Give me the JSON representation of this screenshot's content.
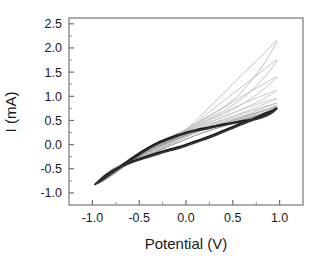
{
  "chart_data": {
    "type": "line",
    "title": "",
    "xlabel": "Potential (V)",
    "ylabel": "I (mA)",
    "xlim": [
      -1.25,
      1.25
    ],
    "ylim": [
      -1.25,
      2.62
    ],
    "xticks": [
      "-1.0",
      "-0.5",
      "0.0",
      "0.5",
      "1.0"
    ],
    "xtick_values": [
      -1.0,
      -0.5,
      0.0,
      0.5,
      1.0
    ],
    "yticks": [
      "2.5",
      "2.0",
      "1.5",
      "1.0",
      "0.5",
      "0.0",
      "-0.5",
      "-1.0"
    ],
    "ytick_values": [
      2.5,
      2.0,
      1.5,
      1.0,
      0.5,
      0.0,
      -0.5,
      -1.0
    ],
    "minor_ticks": true,
    "grid": false,
    "legend": "none",
    "series": [
      {
        "name": "cycle-1",
        "color": "#b9b9b9",
        "width": 0.9,
        "anodic_peak": 2.15,
        "cathodic_min": -0.82,
        "forward": [
          [
            -0.97,
            -0.82
          ],
          [
            -0.8,
            -0.52
          ],
          [
            -0.6,
            -0.32
          ],
          [
            -0.4,
            -0.14
          ],
          [
            -0.2,
            0.06
          ],
          [
            -0.05,
            0.24
          ],
          [
            0.05,
            0.4
          ],
          [
            0.2,
            0.68
          ],
          [
            0.4,
            1.06
          ],
          [
            0.6,
            1.45
          ],
          [
            0.8,
            1.82
          ],
          [
            0.97,
            2.15
          ]
        ],
        "reverse": [
          [
            0.97,
            2.15
          ],
          [
            0.85,
            1.72
          ],
          [
            0.7,
            1.33
          ],
          [
            0.55,
            1.0
          ],
          [
            0.4,
            0.78
          ],
          [
            0.25,
            0.6
          ],
          [
            0.1,
            0.44
          ],
          [
            0.0,
            0.32
          ],
          [
            -0.15,
            0.18
          ],
          [
            -0.35,
            0.0
          ],
          [
            -0.55,
            -0.22
          ],
          [
            -0.75,
            -0.5
          ],
          [
            -0.9,
            -0.72
          ],
          [
            -0.97,
            -0.82
          ]
        ]
      },
      {
        "name": "cycle-2",
        "color": "#bdbdbd",
        "width": 0.9,
        "anodic_peak": 1.75,
        "cathodic_min": -0.82,
        "forward": [
          [
            -0.97,
            -0.82
          ],
          [
            -0.8,
            -0.53
          ],
          [
            -0.6,
            -0.33
          ],
          [
            -0.4,
            -0.16
          ],
          [
            -0.2,
            0.04
          ],
          [
            -0.05,
            0.22
          ],
          [
            0.05,
            0.36
          ],
          [
            0.2,
            0.6
          ],
          [
            0.4,
            0.9
          ],
          [
            0.6,
            1.2
          ],
          [
            0.8,
            1.5
          ],
          [
            0.97,
            1.75
          ]
        ],
        "reverse": [
          [
            0.97,
            1.75
          ],
          [
            0.85,
            1.42
          ],
          [
            0.7,
            1.12
          ],
          [
            0.55,
            0.88
          ],
          [
            0.4,
            0.7
          ],
          [
            0.25,
            0.55
          ],
          [
            0.1,
            0.41
          ],
          [
            0.0,
            0.3
          ],
          [
            -0.15,
            0.17
          ],
          [
            -0.35,
            -0.01
          ],
          [
            -0.55,
            -0.23
          ],
          [
            -0.75,
            -0.51
          ],
          [
            -0.9,
            -0.73
          ],
          [
            -0.97,
            -0.82
          ]
        ]
      },
      {
        "name": "cycle-3",
        "color": "#c0c0c0",
        "width": 0.9,
        "anodic_peak": 1.4,
        "cathodic_min": -0.82,
        "forward": [
          [
            -0.97,
            -0.82
          ],
          [
            -0.8,
            -0.54
          ],
          [
            -0.6,
            -0.34
          ],
          [
            -0.4,
            -0.17
          ],
          [
            -0.2,
            0.03
          ],
          [
            -0.05,
            0.2
          ],
          [
            0.05,
            0.33
          ],
          [
            0.2,
            0.53
          ],
          [
            0.4,
            0.76
          ],
          [
            0.6,
            1.0
          ],
          [
            0.8,
            1.22
          ],
          [
            0.97,
            1.4
          ]
        ],
        "reverse": [
          [
            0.97,
            1.4
          ],
          [
            0.85,
            1.18
          ],
          [
            0.7,
            0.96
          ],
          [
            0.55,
            0.78
          ],
          [
            0.4,
            0.63
          ],
          [
            0.25,
            0.51
          ],
          [
            0.1,
            0.39
          ],
          [
            0.0,
            0.29
          ],
          [
            -0.15,
            0.16
          ],
          [
            -0.35,
            -0.02
          ],
          [
            -0.55,
            -0.24
          ],
          [
            -0.75,
            -0.52
          ],
          [
            -0.9,
            -0.73
          ],
          [
            -0.97,
            -0.82
          ]
        ]
      },
      {
        "name": "cycle-4",
        "color": "#c3c3c3",
        "width": 0.9,
        "anodic_peak": 1.12,
        "cathodic_min": -0.82,
        "forward": [
          [
            -0.97,
            -0.82
          ],
          [
            -0.8,
            -0.55
          ],
          [
            -0.6,
            -0.35
          ],
          [
            -0.4,
            -0.18
          ],
          [
            -0.2,
            0.02
          ],
          [
            -0.05,
            0.18
          ],
          [
            0.05,
            0.3
          ],
          [
            0.2,
            0.47
          ],
          [
            0.4,
            0.66
          ],
          [
            0.6,
            0.84
          ],
          [
            0.8,
            1.0
          ],
          [
            0.97,
            1.12
          ]
        ],
        "reverse": [
          [
            0.97,
            1.12
          ],
          [
            0.85,
            0.97
          ],
          [
            0.7,
            0.82
          ],
          [
            0.55,
            0.69
          ],
          [
            0.4,
            0.57
          ],
          [
            0.25,
            0.47
          ],
          [
            0.1,
            0.37
          ],
          [
            0.0,
            0.28
          ],
          [
            -0.15,
            0.15
          ],
          [
            -0.35,
            -0.03
          ],
          [
            -0.55,
            -0.25
          ],
          [
            -0.75,
            -0.53
          ],
          [
            -0.9,
            -0.74
          ],
          [
            -0.97,
            -0.82
          ]
        ]
      },
      {
        "name": "cycle-5",
        "color": "#c6c6c6",
        "width": 0.9,
        "anodic_peak": 0.96,
        "cathodic_min": -0.82,
        "forward": [
          [
            -0.97,
            -0.82
          ],
          [
            -0.8,
            -0.56
          ],
          [
            -0.6,
            -0.36
          ],
          [
            -0.4,
            -0.19
          ],
          [
            -0.2,
            0.01
          ],
          [
            -0.05,
            0.16
          ],
          [
            0.05,
            0.27
          ],
          [
            0.2,
            0.42
          ],
          [
            0.4,
            0.58
          ],
          [
            0.6,
            0.73
          ],
          [
            0.8,
            0.86
          ],
          [
            0.97,
            0.96
          ]
        ],
        "reverse": [
          [
            0.97,
            0.96
          ],
          [
            0.85,
            0.85
          ],
          [
            0.7,
            0.73
          ],
          [
            0.55,
            0.62
          ],
          [
            0.4,
            0.52
          ],
          [
            0.25,
            0.43
          ],
          [
            0.1,
            0.35
          ],
          [
            0.0,
            0.26
          ],
          [
            -0.15,
            0.14
          ],
          [
            -0.35,
            -0.04
          ],
          [
            -0.55,
            -0.26
          ],
          [
            -0.75,
            -0.54
          ],
          [
            -0.9,
            -0.74
          ],
          [
            -0.97,
            -0.82
          ]
        ]
      },
      {
        "name": "cycle-6",
        "color": "#bcbcbc",
        "width": 0.9,
        "anodic_peak": 0.86,
        "cathodic_min": -0.82,
        "forward": [
          [
            -0.97,
            -0.82
          ],
          [
            -0.8,
            -0.57
          ],
          [
            -0.6,
            -0.37
          ],
          [
            -0.4,
            -0.2
          ],
          [
            -0.2,
            0.0
          ],
          [
            -0.05,
            0.14
          ],
          [
            0.05,
            0.24
          ],
          [
            0.2,
            0.37
          ],
          [
            0.4,
            0.51
          ],
          [
            0.6,
            0.64
          ],
          [
            0.8,
            0.76
          ],
          [
            0.97,
            0.86
          ]
        ],
        "reverse": [
          [
            0.97,
            0.86
          ],
          [
            0.85,
            0.77
          ],
          [
            0.7,
            0.66
          ],
          [
            0.55,
            0.57
          ],
          [
            0.4,
            0.48
          ],
          [
            0.25,
            0.4
          ],
          [
            0.1,
            0.32
          ],
          [
            0.0,
            0.25
          ],
          [
            -0.15,
            0.13
          ],
          [
            -0.35,
            -0.05
          ],
          [
            -0.55,
            -0.27
          ],
          [
            -0.75,
            -0.55
          ],
          [
            -0.9,
            -0.75
          ],
          [
            -0.97,
            -0.82
          ]
        ]
      },
      {
        "name": "cycle-7",
        "color": "#a8a8a8",
        "width": 1.0,
        "anodic_peak": 0.8,
        "cathodic_min": -0.82,
        "forward": [
          [
            -0.97,
            -0.82
          ],
          [
            -0.8,
            -0.58
          ],
          [
            -0.6,
            -0.38
          ],
          [
            -0.4,
            -0.21
          ],
          [
            -0.2,
            -0.02
          ],
          [
            -0.05,
            0.11
          ],
          [
            0.05,
            0.2
          ],
          [
            0.2,
            0.32
          ],
          [
            0.4,
            0.45
          ],
          [
            0.6,
            0.57
          ],
          [
            0.8,
            0.69
          ],
          [
            0.97,
            0.8
          ]
        ],
        "reverse": [
          [
            0.97,
            0.8
          ],
          [
            0.85,
            0.71
          ],
          [
            0.7,
            0.61
          ],
          [
            0.55,
            0.52
          ],
          [
            0.4,
            0.44
          ],
          [
            0.25,
            0.36
          ],
          [
            0.1,
            0.29
          ],
          [
            0.0,
            0.22
          ],
          [
            -0.15,
            0.11
          ],
          [
            -0.35,
            -0.07
          ],
          [
            -0.55,
            -0.29
          ],
          [
            -0.75,
            -0.56
          ],
          [
            -0.9,
            -0.76
          ],
          [
            -0.97,
            -0.82
          ]
        ]
      },
      {
        "name": "cycle-8",
        "color": "#8c8c8c",
        "width": 1.0,
        "anodic_peak": 0.77,
        "cathodic_min": -0.82,
        "forward": [
          [
            -0.97,
            -0.82
          ],
          [
            -0.8,
            -0.59
          ],
          [
            -0.6,
            -0.39
          ],
          [
            -0.4,
            -0.23
          ],
          [
            -0.2,
            -0.05
          ],
          [
            -0.05,
            0.07
          ],
          [
            0.05,
            0.15
          ],
          [
            0.2,
            0.26
          ],
          [
            0.4,
            0.38
          ],
          [
            0.6,
            0.5
          ],
          [
            0.8,
            0.63
          ],
          [
            0.97,
            0.77
          ]
        ],
        "reverse": [
          [
            0.97,
            0.77
          ],
          [
            0.85,
            0.67
          ],
          [
            0.7,
            0.57
          ],
          [
            0.55,
            0.49
          ],
          [
            0.4,
            0.41
          ],
          [
            0.25,
            0.33
          ],
          [
            0.1,
            0.26
          ],
          [
            0.0,
            0.19
          ],
          [
            -0.15,
            0.08
          ],
          [
            -0.35,
            -0.09
          ],
          [
            -0.55,
            -0.31
          ],
          [
            -0.75,
            -0.58
          ],
          [
            -0.9,
            -0.77
          ],
          [
            -0.97,
            -0.82
          ]
        ]
      },
      {
        "name": "cycle-final-dark",
        "color": "#1c1c1c",
        "width": 1.9,
        "anodic_peak": 0.75,
        "cathodic_min": -0.82,
        "forward": [
          [
            -0.97,
            -0.82
          ],
          [
            -0.85,
            -0.62
          ],
          [
            -0.7,
            -0.45
          ],
          [
            -0.55,
            -0.33
          ],
          [
            -0.4,
            -0.23
          ],
          [
            -0.25,
            -0.14
          ],
          [
            -0.1,
            -0.06
          ],
          [
            0.0,
            0.0
          ],
          [
            0.1,
            0.07
          ],
          [
            0.25,
            0.17
          ],
          [
            0.4,
            0.29
          ],
          [
            0.55,
            0.41
          ],
          [
            0.7,
            0.52
          ],
          [
            0.82,
            0.62
          ],
          [
            0.92,
            0.7
          ],
          [
            0.97,
            0.75
          ]
        ],
        "reverse": [
          [
            0.97,
            0.75
          ],
          [
            0.9,
            0.66
          ],
          [
            0.8,
            0.57
          ],
          [
            0.7,
            0.52
          ],
          [
            0.55,
            0.47
          ],
          [
            0.4,
            0.42
          ],
          [
            0.25,
            0.36
          ],
          [
            0.1,
            0.3
          ],
          [
            0.0,
            0.25
          ],
          [
            -0.12,
            0.18
          ],
          [
            -0.28,
            0.06
          ],
          [
            -0.45,
            -0.12
          ],
          [
            -0.62,
            -0.34
          ],
          [
            -0.78,
            -0.56
          ],
          [
            -0.9,
            -0.73
          ],
          [
            -0.97,
            -0.82
          ]
        ]
      },
      {
        "name": "cycle-final-dark-inner",
        "color": "#303030",
        "width": 1.5,
        "anodic_peak": 0.72,
        "cathodic_min": -0.8,
        "forward": [
          [
            -0.96,
            -0.8
          ],
          [
            -0.85,
            -0.63
          ],
          [
            -0.7,
            -0.47
          ],
          [
            -0.55,
            -0.35
          ],
          [
            -0.4,
            -0.26
          ],
          [
            -0.25,
            -0.17
          ],
          [
            -0.1,
            -0.09
          ],
          [
            0.0,
            -0.03
          ],
          [
            0.1,
            0.04
          ],
          [
            0.25,
            0.14
          ],
          [
            0.4,
            0.26
          ],
          [
            0.55,
            0.38
          ],
          [
            0.7,
            0.49
          ],
          [
            0.82,
            0.59
          ],
          [
            0.92,
            0.67
          ],
          [
            0.96,
            0.72
          ]
        ],
        "reverse": [
          [
            0.96,
            0.72
          ],
          [
            0.9,
            0.63
          ],
          [
            0.8,
            0.55
          ],
          [
            0.7,
            0.5
          ],
          [
            0.55,
            0.45
          ],
          [
            0.4,
            0.4
          ],
          [
            0.25,
            0.34
          ],
          [
            0.1,
            0.28
          ],
          [
            0.0,
            0.23
          ],
          [
            -0.12,
            0.15
          ],
          [
            -0.28,
            0.03
          ],
          [
            -0.45,
            -0.15
          ],
          [
            -0.62,
            -0.37
          ],
          [
            -0.78,
            -0.58
          ],
          [
            -0.9,
            -0.74
          ],
          [
            -0.96,
            -0.8
          ]
        ]
      }
    ]
  }
}
